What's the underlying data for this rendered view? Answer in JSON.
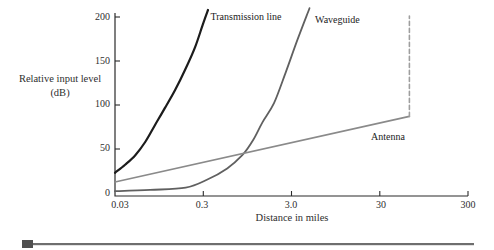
{
  "chart_data": {
    "type": "line",
    "title": "",
    "xlabel": "Distance in miles",
    "ylabel": "Relative input level (dB)",
    "x_scale": "log",
    "xlim": [
      0.03,
      300
    ],
    "ylim": [
      0,
      200
    ],
    "grid": false,
    "legend_position": "inline-labels",
    "axis_color": "#2b2b2b",
    "x_ticks": [
      {
        "value": 0.03,
        "label": "0.03"
      },
      {
        "value": 0.3,
        "label": "0.3"
      },
      {
        "value": 3,
        "label": "3.0"
      },
      {
        "value": 30,
        "label": "30"
      },
      {
        "value": 300,
        "label": "300"
      }
    ],
    "y_ticks": [
      {
        "value": 200,
        "label": "200"
      },
      {
        "value": 150,
        "label": "150"
      },
      {
        "value": 100,
        "label": "100"
      },
      {
        "value": 50,
        "label": "50"
      },
      {
        "value": 0,
        "label": "0"
      }
    ],
    "series": [
      {
        "id": "transmission-line",
        "name": "Transmission line",
        "color": "#1c1c1c",
        "width": 2.2,
        "points": [
          [
            0.03,
            23
          ],
          [
            0.039,
            32
          ],
          [
            0.051,
            43
          ],
          [
            0.066,
            58
          ],
          [
            0.085,
            77
          ],
          [
            0.111,
            97
          ],
          [
            0.144,
            117
          ],
          [
            0.187,
            140
          ],
          [
            0.243,
            166
          ],
          [
            0.3,
            193
          ],
          [
            0.34,
            208
          ]
        ]
      },
      {
        "id": "waveguide",
        "name": "Waveguide",
        "color": "#606060",
        "width": 1.8,
        "points": [
          [
            0.03,
            2
          ],
          [
            0.075,
            3.5
          ],
          [
            0.19,
            6
          ],
          [
            0.33,
            15
          ],
          [
            0.56,
            28
          ],
          [
            0.83,
            43
          ],
          [
            1.1,
            60
          ],
          [
            1.4,
            80
          ],
          [
            1.9,
            102
          ],
          [
            2.6,
            138
          ],
          [
            3.5,
            174
          ],
          [
            4.8,
            210
          ]
        ]
      },
      {
        "id": "antenna",
        "name": "Antenna",
        "color": "#8a8a8a",
        "width": 1.6,
        "points": [
          [
            0.03,
            12.5
          ],
          [
            65,
            87
          ]
        ]
      },
      {
        "id": "antenna-limit",
        "name": "Antenna line-of-sight limit",
        "color": "#9e9e9e",
        "width": 1.6,
        "dash": "4 3",
        "points": [
          [
            65,
            87
          ],
          [
            65,
            201
          ]
        ]
      }
    ],
    "curve_labels": {
      "transmission": "Transmission line",
      "waveguide": "Waveguide",
      "antenna": "Antenna"
    }
  },
  "decoration": {
    "square_color": "#4f4f4f",
    "bar_color": "#6e6e6e"
  }
}
